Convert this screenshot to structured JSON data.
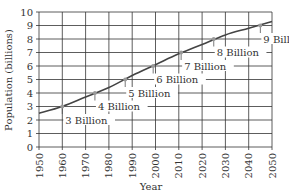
{
  "chart_data": {
    "type": "line",
    "title": "",
    "xlabel": "Year",
    "ylabel": "Population (billions)",
    "xlim": [
      1950,
      2050
    ],
    "ylim": [
      0,
      10
    ],
    "grid": true,
    "x_ticks": [
      "1950",
      "1960",
      "1970",
      "1980",
      "1990",
      "2000",
      "2010",
      "2020",
      "2030",
      "2040",
      "2050"
    ],
    "y_ticks": [
      "0",
      "1",
      "2",
      "3",
      "4",
      "5",
      "6",
      "7",
      "8",
      "9",
      "10"
    ],
    "series": [
      {
        "name": "World population",
        "x": [
          1950,
          1960,
          1970,
          1980,
          1990,
          2000,
          2010,
          2020,
          2030,
          2040,
          2050
        ],
        "values": [
          2.5,
          3.0,
          3.7,
          4.4,
          5.3,
          6.1,
          6.9,
          7.6,
          8.3,
          8.8,
          9.3
        ]
      }
    ],
    "annotations": [
      {
        "text": "3 Billion",
        "year": 1960,
        "value": 3
      },
      {
        "text": "4 Billion",
        "year": 1974,
        "value": 4
      },
      {
        "text": "5 Billion",
        "year": 1987,
        "value": 5
      },
      {
        "text": "6 Billion",
        "year": 1999,
        "value": 6
      },
      {
        "text": "7 Billion",
        "year": 2011,
        "value": 7
      },
      {
        "text": "8 Billion",
        "year": 2025,
        "value": 8
      },
      {
        "text": "9 Billion",
        "year": 2045,
        "value": 9
      }
    ],
    "colors": {
      "line": "#444444",
      "grid": "#333333",
      "marker": "#999999"
    }
  }
}
